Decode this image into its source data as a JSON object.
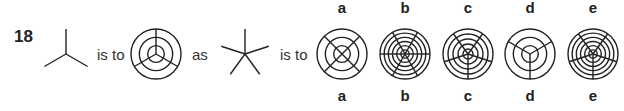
{
  "question": {
    "number": "18",
    "phrase_is_to_1": "is to",
    "phrase_as": "as",
    "phrase_is_to_2": "is to"
  },
  "stem": {
    "figure1": {
      "type": "star",
      "spokes": 3,
      "angles_deg": [
        90,
        210,
        330
      ]
    },
    "figure2": {
      "type": "target",
      "circles": 3,
      "spokes": 3,
      "angles_deg": [
        90,
        210,
        330
      ]
    },
    "figure3": {
      "type": "star",
      "spokes": 5,
      "angles_deg": [
        90,
        162,
        234,
        306,
        18
      ]
    }
  },
  "options": [
    {
      "label": "a",
      "circles": 3,
      "spokes": 4,
      "angles_deg": [
        45,
        135,
        225,
        315
      ]
    },
    {
      "label": "b",
      "circles": 6,
      "spokes": 6,
      "angles_deg": [
        0,
        60,
        120,
        180,
        240,
        300
      ]
    },
    {
      "label": "c",
      "circles": 5,
      "spokes": 5,
      "angles_deg": [
        270,
        198,
        126,
        54,
        342
      ]
    },
    {
      "label": "d",
      "circles": 3,
      "spokes": 3,
      "angles_deg": [
        270,
        150,
        30
      ]
    },
    {
      "label": "e",
      "circles": 6,
      "spokes": 5,
      "angles_deg": [
        270,
        198,
        126,
        54,
        342
      ]
    }
  ],
  "colors": {
    "ink": "#222222",
    "background": "#ffffff"
  }
}
